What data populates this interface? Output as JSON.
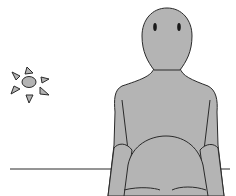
{
  "scene": {
    "description": "Line drawing of a seated gray figure beside a table edge with a small sun symbol",
    "colors": {
      "fill": "#b4b4b4",
      "stroke": "#2a2a2a",
      "background": "#ffffff"
    },
    "elements": {
      "sun": "sun-icon",
      "figure": "person-figure",
      "table_line": "horizon-line"
    }
  }
}
